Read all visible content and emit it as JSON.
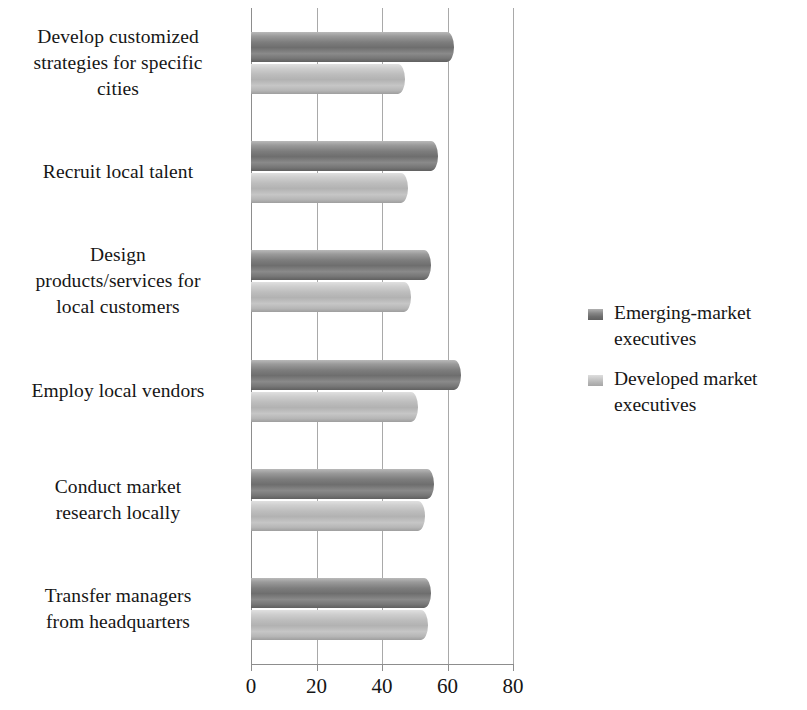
{
  "chart_data": {
    "type": "bar",
    "orientation": "horizontal",
    "title": "",
    "xlabel": "",
    "ylabel": "",
    "xlim": [
      0,
      80
    ],
    "xticks": [
      0,
      20,
      40,
      60,
      80
    ],
    "xtick_labels": [
      "0",
      "20",
      "40",
      "60",
      "80"
    ],
    "grid": true,
    "grid_axis": "x",
    "legend_position": "right",
    "categories": [
      "Develop customized strategies for specific cities",
      "Recruit local talent",
      "Design products/services for local customers",
      "Employ local vendors",
      "Conduct market research locally",
      "Transfer managers from headquarters"
    ],
    "category_lines": [
      [
        "Develop customized",
        "strategies for specific",
        "cities"
      ],
      [
        "Recruit local talent"
      ],
      [
        "Design",
        "products/services for",
        "local customers"
      ],
      [
        "Employ local vendors"
      ],
      [
        "Conduct market",
        "research locally"
      ],
      [
        "Transfer managers",
        "from headquarters"
      ]
    ],
    "series": [
      {
        "name": "Emerging-market executives",
        "color": "#767676",
        "values": [
          62,
          57,
          55,
          64,
          56,
          55
        ]
      },
      {
        "name": "Developed market executives",
        "color": "#bababa",
        "values": [
          47,
          48,
          49,
          51,
          53,
          54
        ]
      }
    ]
  },
  "legend": {
    "items": [
      {
        "label": "Emerging-market executives",
        "swatch": "dark"
      },
      {
        "label": "Developed market executives",
        "swatch": "light"
      }
    ]
  },
  "axis": {
    "tick_labels": [
      "0",
      "20",
      "40",
      "60",
      "80"
    ]
  }
}
